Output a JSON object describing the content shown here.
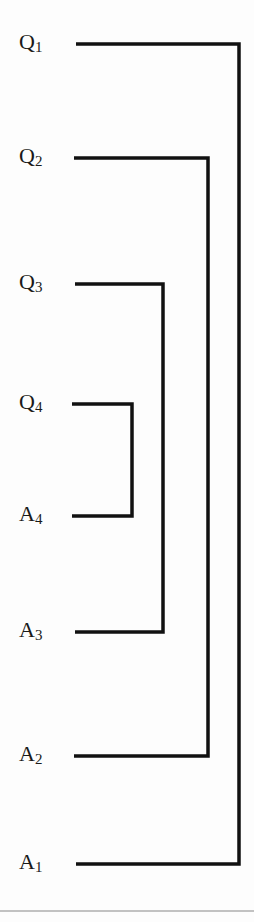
{
  "diagram": {
    "type": "nested-bracket",
    "line_color": "#111111",
    "divider_color": "#888888",
    "labels": [
      {
        "letter": "Q",
        "sub": "1",
        "y": 44
      },
      {
        "letter": "Q",
        "sub": "2",
        "y": 158
      },
      {
        "letter": "Q",
        "sub": "3",
        "y": 284
      },
      {
        "letter": "Q",
        "sub": "4",
        "y": 404
      },
      {
        "letter": "A",
        "sub": "4",
        "y": 516
      },
      {
        "letter": "A",
        "sub": "3",
        "y": 632
      },
      {
        "letter": "A",
        "sub": "2",
        "y": 756
      },
      {
        "letter": "A",
        "sub": "1",
        "y": 864
      }
    ],
    "brackets": [
      {
        "pair": "Q1-A1",
        "top": 44,
        "bottom": 864,
        "x": 239,
        "x_start": 76
      },
      {
        "pair": "Q2-A2",
        "top": 158,
        "bottom": 756,
        "x": 208,
        "x_start": 74
      },
      {
        "pair": "Q3-A3",
        "top": 284,
        "bottom": 632,
        "x": 163,
        "x_start": 75
      },
      {
        "pair": "Q4-A4",
        "top": 404,
        "bottom": 516,
        "x": 132,
        "x_start": 72
      }
    ]
  }
}
